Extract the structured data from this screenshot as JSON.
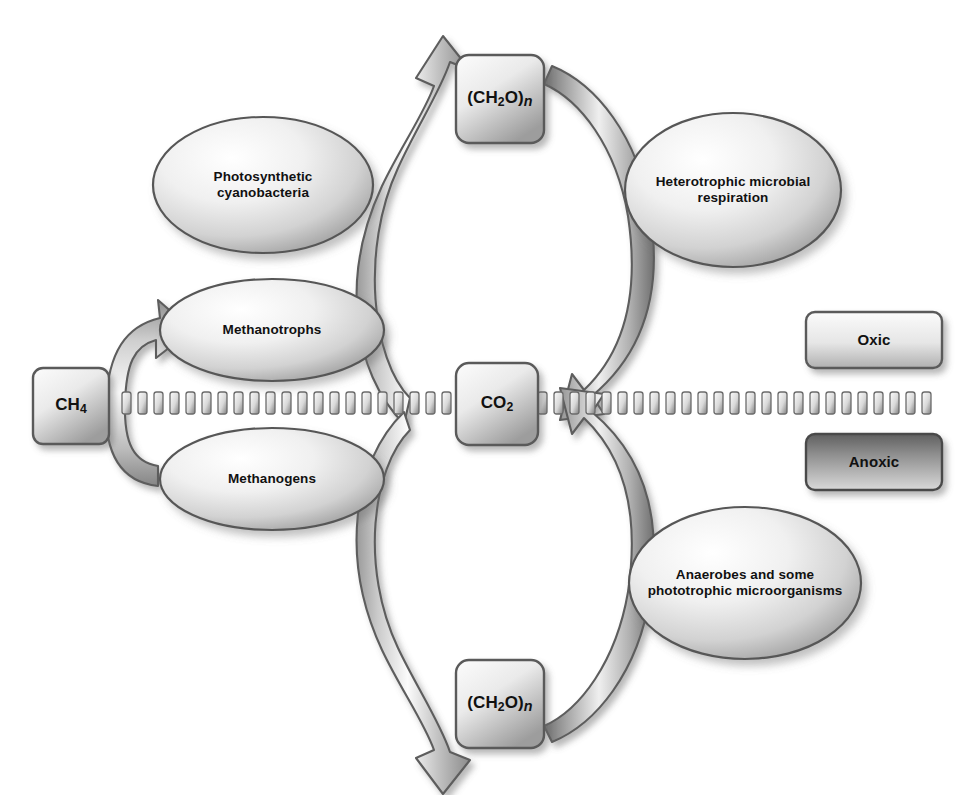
{
  "diagram": {
    "background_color": "#ffffff"
  },
  "boxes": [
    {
      "id": "carbohydrate-top",
      "label": "(CH2O)n",
      "label_html": "(CH<sub>2</sub>O)<span class=\"ital\">n</span>",
      "zone": "oxic",
      "x": 456,
      "y": 55,
      "w": 88,
      "h": 88
    },
    {
      "id": "carbohydrate-bottom",
      "label": "(CH2O)n",
      "label_html": "(CH<sub>2</sub>O)<span class=\"ital\">n</span>",
      "zone": "anoxic",
      "x": 456,
      "y": 660,
      "w": 88,
      "h": 88
    },
    {
      "id": "carbon-dioxide",
      "label": "CO2",
      "label_html": "CO<sub>2</sub>",
      "zone": "boundary",
      "x": 456,
      "y": 363,
      "w": 82,
      "h": 82
    },
    {
      "id": "methane",
      "label": "CH4",
      "label_html": "CH<sub>4</sub>",
      "zone": "boundary",
      "x": 33,
      "y": 368,
      "w": 76,
      "h": 76
    }
  ],
  "ovals": [
    {
      "id": "photosynthetic-cyanobacteria",
      "label": "Photosynthetic cyanobacteria",
      "lines": [
        "Photosynthetic",
        "cyanobacteria"
      ],
      "zone": "oxic",
      "cx": 263,
      "cy": 185,
      "rx": 110,
      "ry": 68
    },
    {
      "id": "heterotrophic-microbial-respiration",
      "label": "Heterotrophic microbial respiration",
      "lines": [
        "Heterotrophic microbial",
        "respiration"
      ],
      "zone": "oxic",
      "cx": 733,
      "cy": 190,
      "rx": 108,
      "ry": 77
    },
    {
      "id": "methanotrophs",
      "label": "Methanotrophs",
      "lines": [
        "Methanotrophs"
      ],
      "zone": "oxic",
      "cx": 272,
      "cy": 330,
      "rx": 112,
      "ry": 51
    },
    {
      "id": "methanogens",
      "label": "Methanogens",
      "lines": [
        "Methanogens"
      ],
      "zone": "anoxic",
      "cx": 272,
      "cy": 479,
      "rx": 112,
      "ry": 51
    },
    {
      "id": "anaerobes-phototrophic",
      "label": "Anaerobes and some phototrophic microorganisms",
      "lines": [
        "Anaerobes and some",
        "phototrophic microorganisms"
      ],
      "zone": "anoxic",
      "cx": 745,
      "cy": 583,
      "rx": 116,
      "ry": 76
    }
  ],
  "legend": {
    "items": [
      {
        "id": "oxic",
        "label": "Oxic",
        "fill_top": "#f2f2f2",
        "fill_bottom": "#b8b8b8",
        "x": 806,
        "y": 312,
        "w": 136,
        "h": 56
      },
      {
        "id": "anoxic",
        "label": "Anoxic",
        "fill_top": "#6e6e6e",
        "fill_bottom": "#d6d6d6",
        "x": 806,
        "y": 434,
        "w": 136,
        "h": 56
      }
    ]
  },
  "boundary": {
    "id": "oxic-anoxic-boundary",
    "style": "dashed",
    "y": 403,
    "x_start": 122,
    "x_end": 942,
    "dash_width": 9,
    "dash_height": 22,
    "dash_gap": 7
  },
  "arrows": [
    {
      "id": "co2-to-carbohydrate-top-left",
      "from": "carbon-dioxide",
      "to": "carbohydrate-top",
      "via": "photosynthetic-cyanobacteria",
      "direction": "up",
      "side": "left"
    },
    {
      "id": "carbohydrate-top-to-co2-right",
      "from": "carbohydrate-top",
      "to": "carbon-dioxide",
      "via": "heterotrophic-microbial-respiration",
      "direction": "down",
      "side": "right"
    },
    {
      "id": "co2-to-carbohydrate-bottom-left",
      "from": "carbon-dioxide",
      "to": "carbohydrate-bottom",
      "via": "methanogens",
      "direction": "down",
      "side": "left"
    },
    {
      "id": "carbohydrate-bottom-to-co2-right",
      "from": "carbohydrate-bottom",
      "to": "carbon-dioxide",
      "via": "anaerobes-phototrophic",
      "direction": "up",
      "side": "right"
    },
    {
      "id": "methane-to-methanotrophs",
      "from": "methane",
      "to": "methanotrophs",
      "direction": "up-right",
      "side": "left"
    }
  ]
}
